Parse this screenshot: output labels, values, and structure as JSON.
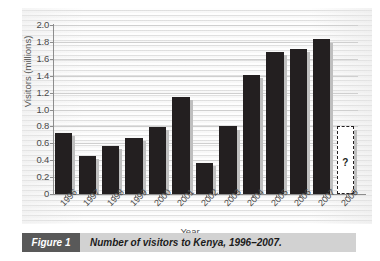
{
  "figure": {
    "tag_label": "Figure 1",
    "caption": "Number of visitors to Kenya, 1996–2007."
  },
  "colors": {
    "bar": "#231f20",
    "bar_shadow": "#bfbfbf",
    "panel": "#f2f2f2",
    "gridline": "#cfcfcf",
    "axis": "#8d8d8d",
    "caption_tag_bg": "#595959",
    "caption_bar_bg": "#d2d2d2"
  },
  "chart_data": {
    "type": "bar",
    "title": "Number of visitors to Kenya, 1996–2007.",
    "xlabel": "Year",
    "ylabel": "Visitors (millions)",
    "ylim": [
      0,
      2.0
    ],
    "ytick_labels": [
      "0",
      "0.2",
      "0.4",
      "0.6",
      "0.8",
      "1.0",
      "1.2",
      "1.4",
      "1.6",
      "1.8",
      "2.0"
    ],
    "ytick_values": [
      0,
      0.2,
      0.4,
      0.6,
      0.8,
      1.0,
      1.2,
      1.4,
      1.6,
      1.8,
      2.0
    ],
    "grid": true,
    "legend": null,
    "categories": [
      "1996",
      "1997",
      "1998",
      "1999",
      "2000",
      "2001",
      "2002",
      "2003",
      "2004",
      "2005",
      "2006",
      "2007",
      "2008"
    ],
    "values": [
      0.72,
      0.45,
      0.57,
      0.66,
      0.79,
      1.15,
      0.37,
      0.8,
      1.41,
      1.68,
      1.72,
      1.83,
      null
    ],
    "unknown_marker": {
      "category": "2008",
      "label": "?",
      "estimated_top": 0.8,
      "style": "dashed-outline"
    },
    "annotations": [
      {
        "text": "?",
        "category": "2008",
        "value": 0.45
      }
    ]
  }
}
